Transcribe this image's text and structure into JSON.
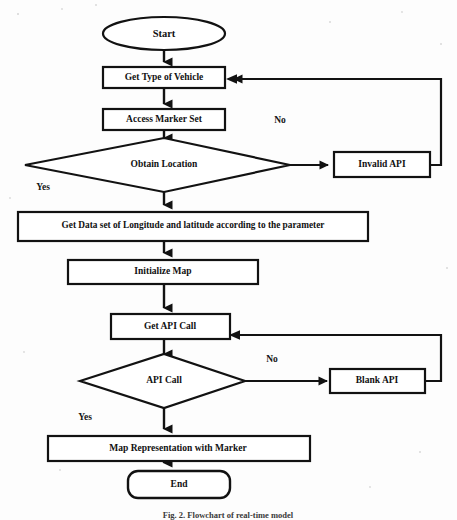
{
  "figure": {
    "caption": "Fig. 2.  Flowchart of real-time model",
    "background_color": "#fdfdfd",
    "ink_color": "#121212"
  },
  "nodes": {
    "start": {
      "label": "Start",
      "shape": "ellipse"
    },
    "get_type_of_vehicle": {
      "label": "Get Type of Vehicle",
      "shape": "rectangle"
    },
    "access_marker_set": {
      "label": "Access Marker Set",
      "shape": "rectangle"
    },
    "obtain_location": {
      "label": "Obtain Location",
      "shape": "diamond"
    },
    "invalid_api": {
      "label": "Invalid API",
      "shape": "rectangle"
    },
    "get_data_set": {
      "label": "Get Data set of Longitude and latitude according to the parameter",
      "shape": "rectangle"
    },
    "initialize_map": {
      "label": "Initialize Map",
      "shape": "rectangle"
    },
    "get_api_call": {
      "label": "Get API Call",
      "shape": "rectangle"
    },
    "api_call": {
      "label": "API Call",
      "shape": "diamond"
    },
    "blank_api": {
      "label": "Blank API",
      "shape": "rectangle"
    },
    "map_representation": {
      "label": "Map Representation with Marker",
      "shape": "rectangle"
    },
    "end": {
      "label": "End",
      "shape": "rounded-rectangle"
    }
  },
  "edge_labels": {
    "obtain_location_no": "No",
    "obtain_location_yes": "Yes",
    "api_call_no": "No",
    "api_call_yes": "Yes"
  }
}
